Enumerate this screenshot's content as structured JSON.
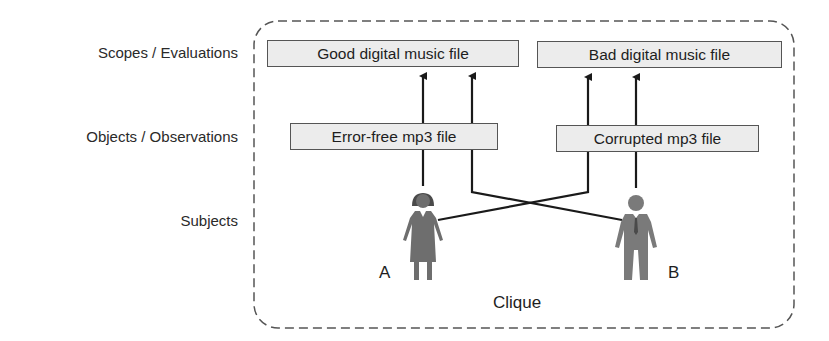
{
  "row_labels": {
    "scopes": "Scopes / Evaluations",
    "objects": "Objects / Observations",
    "subjects": "Subjects"
  },
  "scopes": [
    {
      "label": "Good digital music file"
    },
    {
      "label": "Bad digital music file"
    }
  ],
  "objects": [
    {
      "label": "Error-free mp3 file"
    },
    {
      "label": "Corrupted mp3 file"
    }
  ],
  "subjects": [
    {
      "id": "A",
      "icon": "woman-icon",
      "color": "#6e6e6e"
    },
    {
      "id": "B",
      "icon": "man-icon",
      "color": "#7a7a7a"
    }
  ],
  "group_label": "Clique",
  "colors": {
    "box_fill": "#ececec",
    "box_border": "#555555",
    "line": "#1a1a1a",
    "dashed_border": "#555555"
  }
}
